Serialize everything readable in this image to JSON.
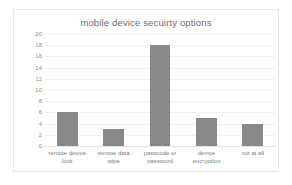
{
  "chart_data": {
    "type": "bar",
    "title": "mobile device secuirty options",
    "xlabel": "",
    "ylabel": "",
    "categories": [
      "remote device lock",
      "remote data wipe",
      "passcode or password",
      "device encryption",
      "not at all"
    ],
    "category_lines": [
      [
        "remote device",
        "lock"
      ],
      [
        "remote data",
        "wipe"
      ],
      [
        "passcode or",
        "password"
      ],
      [
        "device",
        "encryption"
      ],
      [
        "not at all"
      ]
    ],
    "values": [
      6,
      3,
      18,
      5,
      4
    ],
    "ylim": [
      0,
      20
    ],
    "yticks": [
      20,
      18,
      16,
      14,
      12,
      10,
      8,
      6,
      4,
      2,
      0
    ],
    "grid": true,
    "legend": "none",
    "colors": {
      "bar": "#888888",
      "title": "#6b6b6b",
      "tick_label": "#8a8a8a",
      "gridline": "#f1f1f1",
      "border": "#e6e6e6",
      "background": "#ffffff"
    }
  }
}
